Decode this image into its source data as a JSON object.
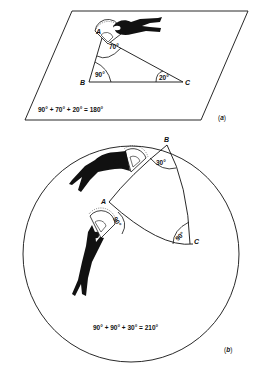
{
  "figure_a": {
    "caption": "(a)",
    "caption_letter": "a",
    "vertices": {
      "A": "A",
      "B": "B",
      "C": "C"
    },
    "angles": {
      "A": "70°",
      "B": "90°",
      "C": "20°"
    },
    "equation": "90° + 70° + 20° = 180°",
    "surface": "plane"
  },
  "figure_b": {
    "caption": "(b)",
    "caption_letter": "b",
    "vertices": {
      "A": "A",
      "B": "B",
      "C": "C"
    },
    "angles": {
      "A": "90°",
      "B": "30°",
      "C": "90°"
    },
    "equation": "90° + 90° + 30° = 210°",
    "surface": "sphere"
  }
}
